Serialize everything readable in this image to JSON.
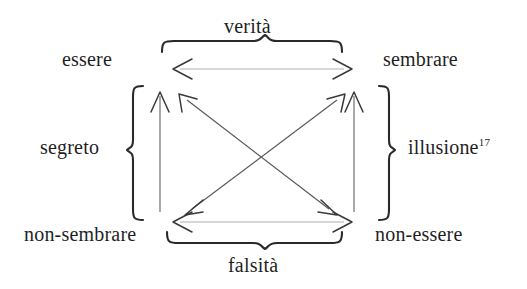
{
  "figure": {
    "type": "semiotic-square",
    "language": "it",
    "background_color": "#ffffff",
    "ink_color": "#2a2a2a",
    "faint_ink_color": "#9a9a9a"
  },
  "corners": {
    "top_left": "essere",
    "top_right": "sembrare",
    "bottom_left": "non-sembrare",
    "bottom_right": "non-essere"
  },
  "braces": {
    "top": {
      "label": "verità",
      "orientation": "down"
    },
    "bottom": {
      "label": "falsità",
      "orientation": "up"
    },
    "left": {
      "label": "segreto",
      "orientation": "left"
    },
    "right": {
      "label": "illusione",
      "footnote": "17",
      "orientation": "right"
    }
  },
  "relations": [
    {
      "name": "top-horizontal",
      "from": "essere",
      "to": "sembrare",
      "arrow": "double"
    },
    {
      "name": "bottom-horizontal",
      "from": "non-sembrare",
      "to": "non-essere",
      "arrow": "double"
    },
    {
      "name": "left-vertical",
      "from": "non-sembrare",
      "to": "essere",
      "arrow": "single-up"
    },
    {
      "name": "right-vertical",
      "from": "non-essere",
      "to": "sembrare",
      "arrow": "single-up"
    },
    {
      "name": "diagonal-nw-se",
      "from": "essere",
      "to": "non-essere",
      "arrow": "double"
    },
    {
      "name": "diagonal-ne-sw",
      "from": "sembrare",
      "to": "non-sembrare",
      "arrow": "double"
    }
  ]
}
